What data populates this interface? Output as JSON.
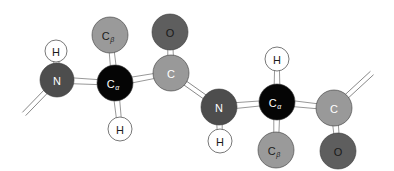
{
  "diagram": {
    "colors": {
      "N": "#4d4d4d",
      "C_alpha": "#050505",
      "C_beta": "#9a9a9a",
      "C": "#999999",
      "O": "#5e5e5e",
      "H": "#ffffff",
      "bond": "#ffffff",
      "bond_stroke": "#6b6b6b",
      "label_light": "#ffffff",
      "label_dark": "#1a1a1a"
    },
    "atoms": [
      {
        "id": "n1",
        "element": "N",
        "label": "N",
        "sub": "",
        "x": 57,
        "y": 80,
        "r": 17
      },
      {
        "id": "h1",
        "element": "H",
        "label": "H",
        "sub": "",
        "x": 56,
        "y": 51,
        "r": 11
      },
      {
        "id": "cb1",
        "element": "C_beta",
        "label": "C",
        "sub": "β",
        "x": 110,
        "y": 35,
        "r": 18
      },
      {
        "id": "ca1",
        "element": "C_alpha",
        "label": "C",
        "sub": "α",
        "x": 115,
        "y": 83,
        "r": 18
      },
      {
        "id": "h2",
        "element": "H",
        "label": "H",
        "sub": "",
        "x": 120,
        "y": 129,
        "r": 12
      },
      {
        "id": "o1",
        "element": "O",
        "label": "O",
        "sub": "",
        "x": 170,
        "y": 32,
        "r": 18
      },
      {
        "id": "c1",
        "element": "C",
        "label": "C",
        "sub": "",
        "x": 171,
        "y": 73,
        "r": 18
      },
      {
        "id": "n2",
        "element": "N",
        "label": "N",
        "sub": "",
        "x": 219,
        "y": 107,
        "r": 18
      },
      {
        "id": "h3",
        "element": "H",
        "label": "H",
        "sub": "",
        "x": 220,
        "y": 141,
        "r": 12
      },
      {
        "id": "ca2",
        "element": "C_alpha",
        "label": "C",
        "sub": "α",
        "x": 277,
        "y": 102,
        "r": 18
      },
      {
        "id": "h4",
        "element": "H",
        "label": "H",
        "sub": "",
        "x": 277,
        "y": 59,
        "r": 12
      },
      {
        "id": "cb2",
        "element": "C_beta",
        "label": "C",
        "sub": "β",
        "x": 276,
        "y": 150,
        "r": 18
      },
      {
        "id": "c2",
        "element": "C",
        "label": "C",
        "sub": "",
        "x": 334,
        "y": 108,
        "r": 18
      },
      {
        "id": "o2",
        "element": "O",
        "label": "O",
        "sub": "",
        "x": 338,
        "y": 151,
        "r": 18
      }
    ],
    "bonds": [
      {
        "from": "n1",
        "to": "h1",
        "type": "wedge"
      },
      {
        "from": "n1",
        "to": "ca1",
        "type": "wedge"
      },
      {
        "from": "ca1",
        "to": "cb1",
        "type": "wedge"
      },
      {
        "from": "ca1",
        "to": "h2",
        "type": "wedge"
      },
      {
        "from": "ca1",
        "to": "c1",
        "type": "wedge"
      },
      {
        "from": "c1",
        "to": "o1",
        "type": "wedge"
      },
      {
        "from": "c1",
        "to": "n2",
        "type": "double"
      },
      {
        "from": "n2",
        "to": "h3",
        "type": "wedge"
      },
      {
        "from": "n2",
        "to": "ca2",
        "type": "wedge"
      },
      {
        "from": "ca2",
        "to": "h4",
        "type": "wedge"
      },
      {
        "from": "ca2",
        "to": "cb2",
        "type": "wedge"
      },
      {
        "from": "ca2",
        "to": "c2",
        "type": "wedge"
      },
      {
        "from": "c2",
        "to": "o2",
        "type": "wedge"
      }
    ],
    "dangling_bonds": [
      {
        "from": "n1",
        "x2": 24,
        "y2": 114,
        "type": "double"
      },
      {
        "from": "c2",
        "x2": 372,
        "y2": 73,
        "type": "double"
      }
    ]
  }
}
